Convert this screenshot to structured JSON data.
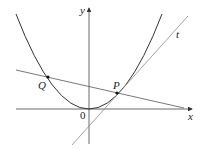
{
  "diagram": {
    "labels": {
      "x_axis": "x",
      "y_axis": "y",
      "origin": "0",
      "point_p": "P",
      "point_q": "Q",
      "tangent": "t"
    },
    "colors": {
      "curve": "#333333",
      "axis": "#444444",
      "tangent": "#8a8a8a",
      "secant": "#555555",
      "point": "#111111"
    }
  }
}
